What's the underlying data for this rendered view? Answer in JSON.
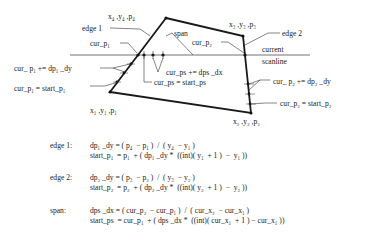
{
  "diagram": {
    "vertices": {
      "v1": {
        "label": "x₁ ,y₁ ,p₁"
      },
      "v2": {
        "label": "x₂ ,y₂ ,p₂"
      },
      "v3": {
        "label": "x₃ ,y₃ ,p₃"
      },
      "v4": {
        "label": "x₄ ,y₄ ,p₄"
      }
    },
    "labels": {
      "edge1": "edge 1",
      "edge2": "edge 2",
      "span": "span",
      "cur_p1": "cur_p₁",
      "cur_p2": "cur_p₂",
      "current": "current",
      "scanline": "scanline",
      "cur_p1_inc": "cur_ p₁  += dp₁ _dy",
      "cur_p1_start": "cur_p₁ = start_p₁",
      "cur_ps_inc": "cur_ps  += dps _dx",
      "cur_ps_start": "cur_ps  = start_ps",
      "cur_p2_inc": "cur_ p₂  += dp₂ _dy",
      "cur_p2_start": "cur_p₂  = start_p₂"
    },
    "colors": {
      "line": "#1a1a1a",
      "text": "#222222",
      "background": "#ffffff"
    }
  },
  "equations": [
    {
      "label": "edge 1:",
      "lines": [
        "dp₁ _dy = ( p₄  − p₁ )  /  ( y₄  − y₁ )",
        "start_p₁  = p₁  + ( dp₁ _dy *  ((int)( y₁  + 1 )  −  y₁ ))"
      ]
    },
    {
      "label": "edge 2:",
      "lines": [
        "dp₂ _dy = ( p₃  − p₂ )  /  ( y₃  − y₂ )",
        "start_p₂  = p₂  + ( dp₂ _dy *  ((int)( y₂  + 1 )  −  y₂ ))"
      ]
    },
    {
      "label": "span:",
      "lines": [
        "dps _dx = ( cur_p₂  − cur_p₁ )  /  ( cur_x₂  − cur_x₁ )",
        "start_ps  = cur_p₁  + ( dps _dx *  ((int)( cur_x₁  + 1 ) − cur_x₁ ))"
      ]
    }
  ]
}
